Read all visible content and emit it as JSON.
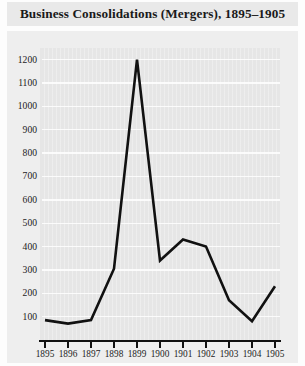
{
  "title": "Business Consolidations (Mergers), 1895–1905",
  "colors": {
    "title_band": "#e9e9e9",
    "chart_band": "#eeeeee",
    "plot_background": "#e6e6e6",
    "gridline": "#fbfbfb",
    "line": "#111111",
    "axis": "#111111",
    "text": "#1c1c1c"
  },
  "chart_data": {
    "type": "line",
    "title": "Business Consolidations (Mergers), 1895–1905",
    "xlabel": "",
    "ylabel": "",
    "x": [
      1895,
      1896,
      1897,
      1898,
      1899,
      1900,
      1901,
      1902,
      1903,
      1904,
      1905
    ],
    "categories": [
      "1895",
      "1896",
      "1897",
      "1898",
      "1899",
      "1900",
      "1901",
      "1902",
      "1903",
      "1904",
      "1905"
    ],
    "values": [
      85,
      70,
      85,
      305,
      1200,
      340,
      430,
      400,
      170,
      80,
      230
    ],
    "series": [
      {
        "name": "Business consolidations",
        "values": [
          85,
          70,
          85,
          305,
          1200,
          340,
          430,
          400,
          170,
          80,
          230
        ]
      }
    ],
    "ylim": [
      0,
      1250
    ],
    "xlim": [
      1895,
      1905
    ],
    "yticks": [
      100,
      200,
      300,
      400,
      500,
      600,
      700,
      800,
      900,
      1000,
      1100,
      1200
    ],
    "ytick_labels": [
      "100",
      "200",
      "300",
      "400",
      "500",
      "600",
      "700",
      "800",
      "900",
      "1000",
      "1100",
      "1200"
    ],
    "xticks": [
      1895,
      1896,
      1897,
      1898,
      1899,
      1900,
      1901,
      1902,
      1903,
      1904,
      1905
    ],
    "xtick_labels": [
      "1895",
      "1896",
      "1897",
      "1898",
      "1899",
      "1900",
      "1901",
      "1902",
      "1903",
      "1904",
      "1905"
    ],
    "grid": true,
    "grid_axis": "y",
    "legend": false,
    "legend_position": "none",
    "markers": false,
    "annotations": []
  }
}
